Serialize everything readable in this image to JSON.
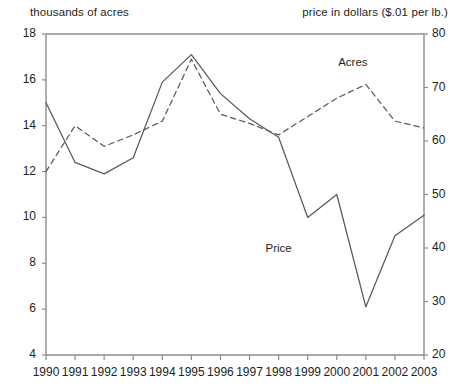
{
  "header": {
    "left_title": "thousands of acres",
    "right_title": "price in dollars ($.01 per lb.)"
  },
  "chart_data": {
    "type": "line",
    "title": "",
    "xlabel": "",
    "ylabel": "thousands of acres",
    "y2label": "price in dollars ($.01 per lb.)",
    "grid": false,
    "legend_position": "inline-annotations",
    "x": [
      1990,
      1991,
      1992,
      1993,
      1994,
      1995,
      1996,
      1997,
      1998,
      1999,
      2000,
      2001,
      2002,
      2003
    ],
    "xtick_labels": [
      "1990",
      "1991",
      "1992",
      "1993",
      "1994",
      "1995",
      "1996",
      "1997",
      "1998",
      "1999",
      "2000",
      "2001",
      "2002",
      "2003"
    ],
    "ylim": [
      4,
      18
    ],
    "ytick_labels": [
      "4",
      "6",
      "8",
      "10",
      "12",
      "14",
      "16",
      "18"
    ],
    "ytick_values": [
      4,
      6,
      8,
      10,
      12,
      14,
      16,
      18
    ],
    "y2lim": [
      20,
      80
    ],
    "y2tick_labels": [
      "20",
      "30",
      "40",
      "50",
      "60",
      "70",
      "80"
    ],
    "y2tick_values": [
      20,
      30,
      40,
      50,
      60,
      70,
      80
    ],
    "series": [
      {
        "name": "Price",
        "axis": "left",
        "style": "solid",
        "color": "#58595b",
        "label_x": 1998.1,
        "label_y": 8.6,
        "values": [
          15.0,
          12.4,
          11.9,
          12.6,
          15.9,
          17.1,
          15.4,
          14.3,
          13.5,
          10.0,
          11.0,
          6.1,
          9.2,
          10.1
        ]
      },
      {
        "name": "Acres",
        "axis": "left",
        "style": "dashed",
        "color": "#58595b",
        "label_x": 2000.6,
        "label_y": 16.7,
        "values": [
          12.0,
          14.0,
          13.1,
          13.6,
          14.2,
          16.9,
          14.5,
          14.1,
          13.6,
          14.4,
          15.2,
          15.8,
          14.2,
          13.9
        ]
      }
    ]
  },
  "axes": {
    "x_tick_count": 14,
    "left_axis_name": "left-value-axis",
    "right_axis_name": "right-value-axis",
    "bottom_axis_name": "year-axis"
  }
}
